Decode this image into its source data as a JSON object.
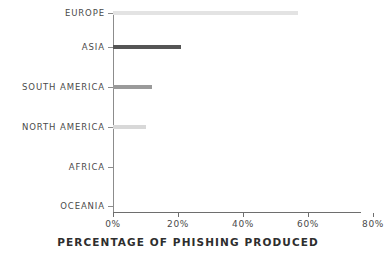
{
  "chart_data": {
    "type": "bar",
    "orientation": "horizontal",
    "title": "",
    "xlabel": "PERCENTAGE OF PHISHING PRODUCED",
    "ylabel": "",
    "categories": [
      "EUROPE",
      "ASIA",
      "SOUTH AMERICA",
      "NORTH AMERICA",
      "AFRICA",
      "OCEANIA"
    ],
    "values": [
      57,
      21,
      12,
      10,
      0,
      0
    ],
    "bar_colors": [
      "#e3e3e3",
      "#555555",
      "#9a9a9a",
      "#d8d8d8",
      "#ffffff",
      "#ffffff"
    ],
    "xlim": [
      0,
      80
    ],
    "xticks": [
      0,
      20,
      40,
      60,
      80
    ],
    "xtick_labels": [
      "0%",
      "20%",
      "40%",
      "60%",
      "80%"
    ],
    "grid": false,
    "legend": false,
    "background_color": "#ffffff",
    "axis_color": "#8c8c8c",
    "text_color": "#4a4a4a",
    "bars": [
      {
        "label": "EUROPE",
        "value": 57,
        "color": "#e3e3e3"
      },
      {
        "label": "ASIA",
        "value": 21,
        "color": "#555555"
      },
      {
        "label": "SOUTH AMERICA",
        "value": 12,
        "color": "#9a9a9a"
      },
      {
        "label": "NORTH AMERICA",
        "value": 10,
        "color": "#d8d8d8"
      },
      {
        "label": "AFRICA",
        "value": 0,
        "color": "#ffffff"
      },
      {
        "label": "OCEANIA",
        "value": 0,
        "color": "#ffffff"
      }
    ]
  }
}
